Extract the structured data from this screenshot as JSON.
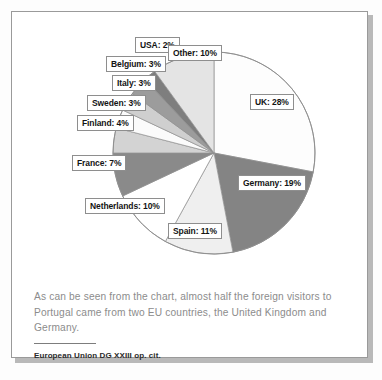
{
  "chart_data": {
    "type": "pie",
    "title": "",
    "unit": "%",
    "legend_position": "callout-labels",
    "categories": [
      "UK",
      "Germany",
      "Spain",
      "Netherlands",
      "France",
      "Finland",
      "Sweden",
      "Italy",
      "Belgium",
      "USA",
      "Other"
    ],
    "values": [
      28,
      19,
      11,
      10,
      7,
      4,
      3,
      3,
      3,
      2,
      10
    ],
    "slice_colors": [
      "#fdfdfd",
      "#848484",
      "#efefef",
      "#ffffff",
      "#8a8a8a",
      "#d3d3d3",
      "#fbfbfb",
      "#cfcfcf",
      "#9c9c9c",
      "#7e7e7e",
      "#e4e4e4"
    ],
    "start_angle_deg": 0,
    "direction": "clockwise",
    "slices": [
      {
        "label": "UK: 28%",
        "name": "UK",
        "value": 28
      },
      {
        "label": "Germany: 19%",
        "name": "Germany",
        "value": 19
      },
      {
        "label": "Spain: 11%",
        "name": "Spain",
        "value": 11
      },
      {
        "label": "Netherlands: 10%",
        "name": "Netherlands",
        "value": 10
      },
      {
        "label": "France: 7%",
        "name": "France",
        "value": 7
      },
      {
        "label": "Finland: 4%",
        "name": "Finland",
        "value": 4
      },
      {
        "label": "Sweden: 3%",
        "name": "Sweden",
        "value": 3
      },
      {
        "label": "Italy: 3%",
        "name": "Italy",
        "value": 3
      },
      {
        "label": "Belgium: 3%",
        "name": "Belgium",
        "value": 3
      },
      {
        "label": "USA: 2%",
        "name": "USA",
        "value": 2
      },
      {
        "label": "Other: 10%",
        "name": "Other",
        "value": 10
      }
    ]
  },
  "caption": {
    "text": "As can be seen from the chart, almost half the foreign visitors to Portugal came from two EU countries, the United Kingdom and Germany."
  },
  "source": {
    "text": "European Union DG XXIII op. cit."
  },
  "colors": {
    "panel_border": "#9a9a9a",
    "panel_shadow": "#b9b9b9",
    "pie_outline": "#8f8f8f",
    "caption_text": "#8c8c8c",
    "source_text": "#2b2b2b",
    "label_border": "#8e8e8e",
    "label_text": "#141414"
  }
}
